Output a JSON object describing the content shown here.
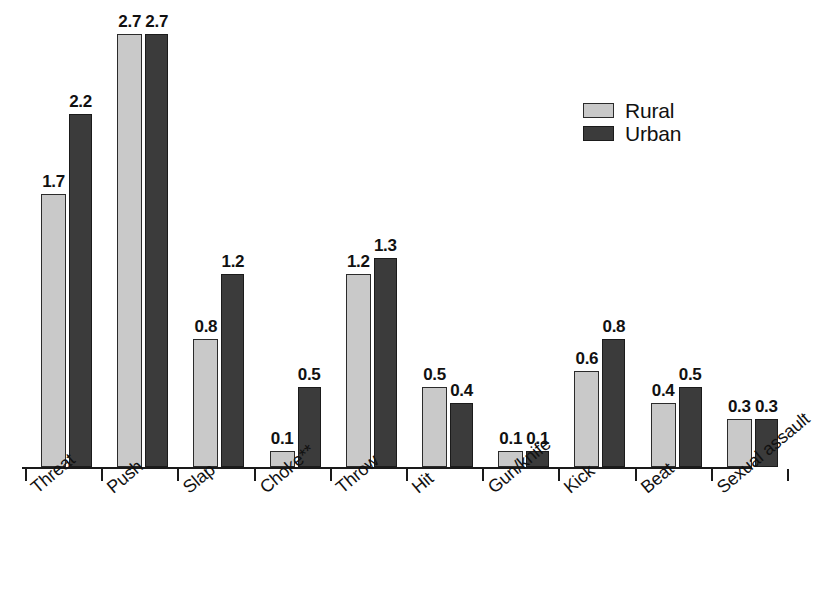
{
  "chart_data": {
    "type": "bar",
    "title": "",
    "subtitle": "",
    "xlabel": "",
    "ylabel": "",
    "grid": false,
    "legend_position": "top-right",
    "ylim": [
      0,
      2.95
    ],
    "categories": [
      "Threat",
      "Push",
      "Slap",
      "Choke**",
      "Throw",
      "Hit",
      "Gun/knife",
      "Kick",
      "Beat",
      "Sexual assault"
    ],
    "series": [
      {
        "name": "Rural",
        "color": "#c9c9c9",
        "values": [
          1.7,
          2.7,
          0.8,
          0.1,
          1.2,
          0.5,
          0.1,
          0.6,
          0.4,
          0.3
        ],
        "labels": [
          "1.7",
          "2.7",
          "0.8",
          "0.1",
          "1.2",
          "0.5",
          "0.1",
          "0.6",
          "0.4",
          "0.3"
        ]
      },
      {
        "name": "Urban",
        "color": "#3b3b3b",
        "values": [
          2.2,
          2.7,
          1.2,
          0.5,
          1.3,
          0.4,
          0.1,
          0.8,
          0.5,
          0.3
        ],
        "labels": [
          "2.2",
          "2.7",
          "1.2",
          "0.5",
          "1.3",
          "0.4",
          "0.1",
          "0.8",
          "0.5",
          "0.3"
        ]
      }
    ]
  },
  "legend": {
    "items": [
      {
        "label": "Rural",
        "color": "#c9c9c9"
      },
      {
        "label": "Urban",
        "color": "#3b3b3b"
      }
    ]
  },
  "axis": {
    "baseline_color": "#1a1a1a",
    "tick_count": 11
  }
}
